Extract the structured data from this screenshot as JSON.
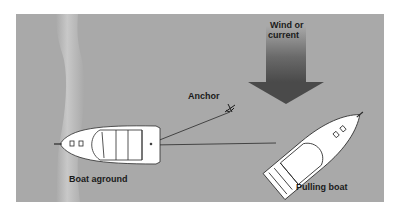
{
  "diagram": {
    "wind_label_line1": "Wind or",
    "wind_label_line2": "current",
    "anchor_label": "Anchor",
    "boat_aground_label": "Boat aground",
    "pulling_boat_label": "Pulling boat",
    "colors": {
      "water": "#a9a9a9",
      "shore_highlight": "#c4c4c4",
      "boat_fill": "#ffffff",
      "line": "#2a2a2a",
      "arrow_dark": "#4a4a4a",
      "background": "#ffffff"
    }
  }
}
